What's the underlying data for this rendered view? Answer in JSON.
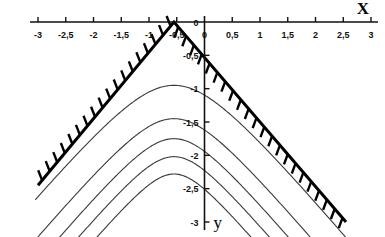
{
  "chart_data": {
    "type": "line",
    "title": "",
    "xlabel": "X",
    "ylabel": "y",
    "xlim": [
      -3,
      3
    ],
    "ylim": [
      -3,
      0
    ],
    "grid": false,
    "legend_position": "none",
    "x_ticks": [
      -3,
      -2.5,
      -2,
      -1.5,
      -1,
      -0.5,
      0,
      0.5,
      1,
      1.5,
      2,
      2.5,
      3
    ],
    "x_tick_labels": [
      "-3",
      "-2,5",
      "-2",
      "-1,5",
      "-1",
      "-0,5",
      "0",
      "0,5",
      "1",
      "1,5",
      "2",
      "2,5",
      "3"
    ],
    "y_ticks": [
      0,
      -0.5,
      -1,
      -1.5,
      -2,
      -2.5,
      -3
    ],
    "y_tick_labels": [
      "0",
      "-0,5",
      "-1",
      "-1,5",
      "-2",
      "-2,5",
      "-3"
    ],
    "decimal_separator": ",",
    "apex": {
      "x": -0.55,
      "y": 0
    },
    "boundary": {
      "name": "hatched-envelope",
      "description": "V-shaped (inverted) straight-line envelope with hatching on the outer side",
      "left_segment": {
        "from": [
          -3.0,
          -2.45
        ],
        "to": [
          -0.55,
          0
        ]
      },
      "right_segment": {
        "from": [
          -0.55,
          0
        ],
        "to": [
          2.55,
          -3.0
        ]
      },
      "left_slope": 1.0,
      "right_slope": -1.0,
      "hatch_side": "outer",
      "hatch_count_left": 18,
      "hatch_count_right": 22
    },
    "series": [
      {
        "name": "curve-1",
        "peak": [
          -0.55,
          -0.95
        ],
        "curvature": 0.62
      },
      {
        "name": "curve-2",
        "peak": [
          -0.55,
          -1.45
        ],
        "curvature": 0.52
      },
      {
        "name": "curve-3",
        "peak": [
          -0.55,
          -1.75
        ],
        "curvature": 0.45
      },
      {
        "name": "curve-4",
        "peak": [
          -0.55,
          -2.02
        ],
        "curvature": 0.4
      },
      {
        "name": "curve-5",
        "peak": [
          -0.55,
          -2.28
        ],
        "curvature": 0.35
      }
    ],
    "curve_count": 5,
    "colors": {
      "axis": "#111111",
      "boundary": "#000000",
      "curve": "#3a3a3a",
      "background": "#ffffff"
    }
  }
}
